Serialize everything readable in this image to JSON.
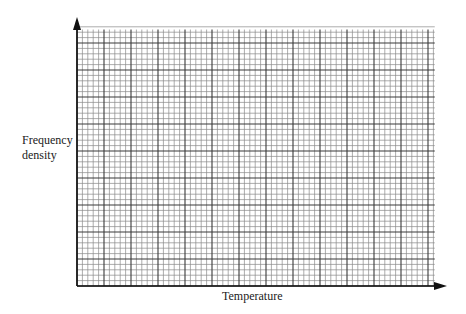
{
  "chart_data": {
    "type": "bar",
    "subtype": "histogram-grid-blank",
    "title": "",
    "xlabel": "Temperature",
    "ylabel": "Frequency density",
    "ylabel_lines": [
      "Frequency",
      "density"
    ],
    "categories": [],
    "values": [],
    "series": [],
    "grid": true,
    "grid_major_cells_x": 13.25,
    "grid_major_cells_y": 9.5,
    "grid_minor_per_major": 5,
    "axis_arrows": true,
    "tick_labels_x": [],
    "tick_labels_y": [],
    "legend": null
  },
  "labels": {
    "ylabel_line1": "Frequency",
    "ylabel_line2": "density",
    "xlabel": "Temperature"
  },
  "colors": {
    "background": "#ffffff",
    "axis": "#111111",
    "grid_major": "#3a3a3a",
    "grid_minor": "#8a8a8a",
    "text": "#1a1a1a"
  }
}
